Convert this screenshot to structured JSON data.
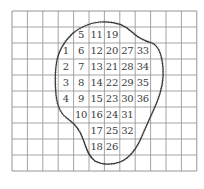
{
  "diagram": {
    "type": "grid-area-estimation",
    "grid": {
      "columns": 12,
      "rows": 10,
      "origin_x": 12,
      "origin_y": 11,
      "cell_width": 15.4,
      "cell_height": 16,
      "line_color": "#9a9a9a",
      "border_color": "#8a8a8a"
    },
    "outline": {
      "color": "#333333",
      "hatched": true
    },
    "labels": [
      {
        "text": "5",
        "col": 4,
        "row": 1
      },
      {
        "text": "11",
        "col": 5,
        "row": 1
      },
      {
        "text": "19",
        "col": 6,
        "row": 1
      },
      {
        "text": "1",
        "col": 3,
        "row": 2
      },
      {
        "text": "6",
        "col": 4,
        "row": 2
      },
      {
        "text": "12",
        "col": 5,
        "row": 2
      },
      {
        "text": "20",
        "col": 6,
        "row": 2
      },
      {
        "text": "27",
        "col": 7,
        "row": 2
      },
      {
        "text": "33",
        "col": 8,
        "row": 2
      },
      {
        "text": "2",
        "col": 3,
        "row": 3
      },
      {
        "text": "7",
        "col": 4,
        "row": 3
      },
      {
        "text": "13",
        "col": 5,
        "row": 3
      },
      {
        "text": "21",
        "col": 6,
        "row": 3
      },
      {
        "text": "28",
        "col": 7,
        "row": 3
      },
      {
        "text": "34",
        "col": 8,
        "row": 3
      },
      {
        "text": "3",
        "col": 3,
        "row": 4
      },
      {
        "text": "8",
        "col": 4,
        "row": 4
      },
      {
        "text": "14",
        "col": 5,
        "row": 4
      },
      {
        "text": "22",
        "col": 6,
        "row": 4
      },
      {
        "text": "29",
        "col": 7,
        "row": 4
      },
      {
        "text": "35",
        "col": 8,
        "row": 4
      },
      {
        "text": "4",
        "col": 3,
        "row": 5
      },
      {
        "text": "9",
        "col": 4,
        "row": 5
      },
      {
        "text": "15",
        "col": 5,
        "row": 5
      },
      {
        "text": "23",
        "col": 6,
        "row": 5
      },
      {
        "text": "30",
        "col": 7,
        "row": 5
      },
      {
        "text": "36",
        "col": 8,
        "row": 5
      },
      {
        "text": "10",
        "col": 4,
        "row": 6
      },
      {
        "text": "16",
        "col": 5,
        "row": 6
      },
      {
        "text": "24",
        "col": 6,
        "row": 6
      },
      {
        "text": "31",
        "col": 7,
        "row": 6
      },
      {
        "text": "17",
        "col": 5,
        "row": 7
      },
      {
        "text": "25",
        "col": 6,
        "row": 7
      },
      {
        "text": "32",
        "col": 7,
        "row": 7
      },
      {
        "text": "18",
        "col": 5,
        "row": 8
      },
      {
        "text": "26",
        "col": 6,
        "row": 8
      }
    ]
  }
}
